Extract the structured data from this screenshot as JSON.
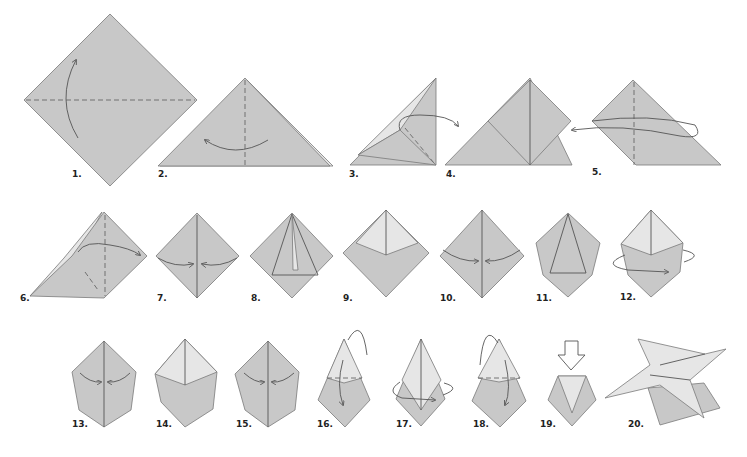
{
  "colors": {
    "paper": "#c8c8c8",
    "paper_light": "#e6e6e6",
    "line": "#555555",
    "background": "#ffffff"
  },
  "steps": [
    {
      "label": "1."
    },
    {
      "label": "2."
    },
    {
      "label": "3."
    },
    {
      "label": "4."
    },
    {
      "label": "5."
    },
    {
      "label": "6."
    },
    {
      "label": "7."
    },
    {
      "label": "8."
    },
    {
      "label": "9."
    },
    {
      "label": "10."
    },
    {
      "label": "11."
    },
    {
      "label": "12."
    },
    {
      "label": "13."
    },
    {
      "label": "14."
    },
    {
      "label": "15."
    },
    {
      "label": "16."
    },
    {
      "label": "17."
    },
    {
      "label": "18."
    },
    {
      "label": "19."
    },
    {
      "label": "20."
    }
  ]
}
